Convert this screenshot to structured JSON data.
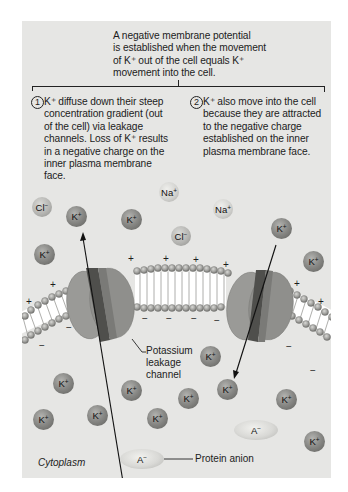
{
  "intro": {
    "lines": [
      "A negative membrane potential",
      "is established when the movement",
      "of K⁺ out of the cell equals K⁺",
      "movement into the cell."
    ]
  },
  "steps": [
    {
      "number": "1",
      "lines": [
        "K⁺ diffuse down their steep",
        "concentration gradient (out",
        "of the cell) via leakage",
        "channels. Loss of K⁺ results",
        "in a negative charge on the",
        "inner plasma membrane",
        "face."
      ]
    },
    {
      "number": "2",
      "lines": [
        "K⁺ also move into the cell",
        "because they are attracted",
        "to the negative charge",
        "established on the inner",
        "plasma membrane face."
      ]
    }
  ],
  "ions": {
    "k": {
      "base": "K",
      "charge": "+"
    },
    "na": {
      "base": "Na",
      "charge": "+"
    },
    "cl": {
      "base": "Cl",
      "charge": "−"
    },
    "anion": {
      "base": "A",
      "charge": "−"
    }
  },
  "labels": {
    "channel": [
      "Potassium",
      "leakage",
      "channel"
    ],
    "protein_anion": "Protein anion",
    "cytoplasm": "Cytoplasm"
  },
  "charges": {
    "outside": "+",
    "inside": "−"
  },
  "colors": {
    "panel": "#e6e6e4",
    "channel_light": "#9c9c99",
    "channel_dark": "#5c5c59",
    "lipid_head": "#a8a8a5"
  }
}
